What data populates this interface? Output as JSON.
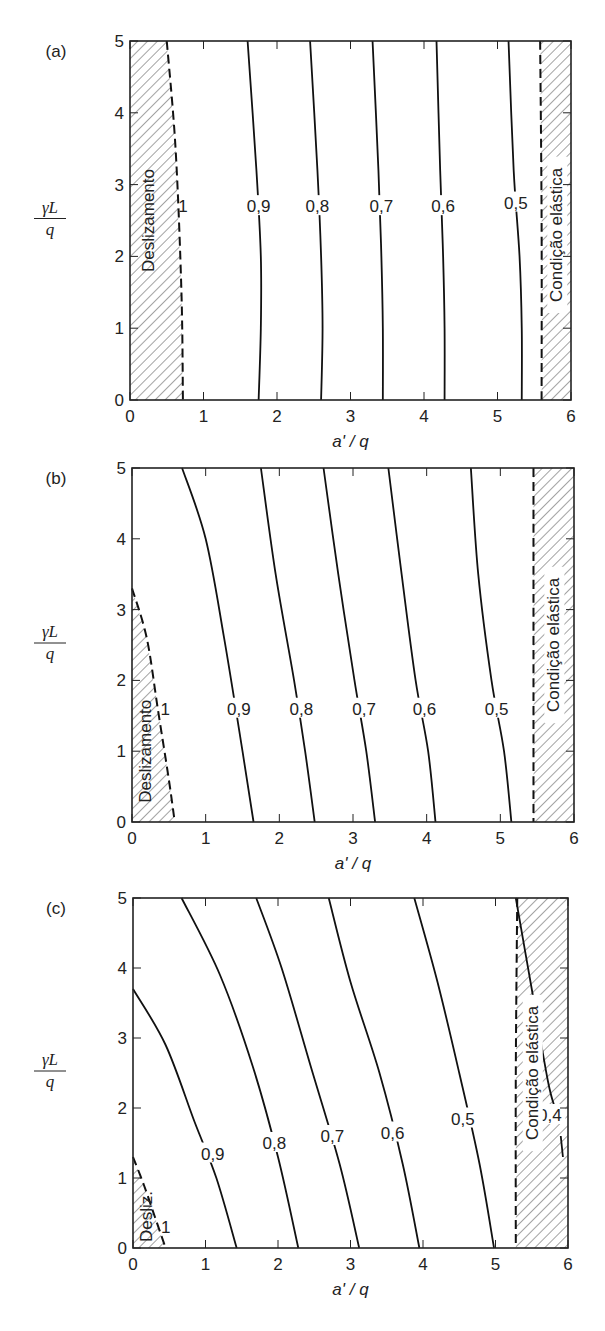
{
  "chart_data": [
    {
      "type": "line",
      "panel": "(a)",
      "xlabel": "a' / q",
      "ylabel_num": "γL",
      "ylabel_den": "q",
      "xlim": [
        0,
        6
      ],
      "ylim": [
        0,
        5
      ],
      "xticks": [
        "0",
        "1",
        "2",
        "3",
        "4",
        "5",
        "6"
      ],
      "yticks": [
        "0",
        "1",
        "2",
        "3",
        "4",
        "5"
      ],
      "frame": {
        "x0": 130,
        "x1": 571,
        "y0": 400,
        "y1": 41
      },
      "zones": [
        {
          "label": "Deslizamento",
          "side": "left",
          "boundary": [
            [
              0.5,
              5
            ],
            [
              0.62,
              3.5
            ],
            [
              0.7,
              1.5
            ],
            [
              0.72,
              0
            ]
          ],
          "label_pos": [
            0.25,
            2.5
          ]
        },
        {
          "label": "Condição elástica",
          "side": "right",
          "boundary": [
            [
              5.58,
              5
            ],
            [
              5.6,
              2.5
            ],
            [
              5.6,
              0
            ]
          ],
          "label_pos": [
            5.8,
            2.3
          ]
        }
      ],
      "series": [
        {
          "name": "1",
          "label_pos": [
            0.72,
            2.7
          ],
          "points": []
        },
        {
          "name": "0,9",
          "label_pos": [
            1.75,
            2.7
          ],
          "points": [
            [
              1.6,
              5
            ],
            [
              1.72,
              3.2
            ],
            [
              1.78,
              2
            ],
            [
              1.78,
              1
            ],
            [
              1.75,
              0
            ]
          ]
        },
        {
          "name": "0,8",
          "label_pos": [
            2.55,
            2.7
          ],
          "points": [
            [
              2.45,
              5
            ],
            [
              2.55,
              3.2
            ],
            [
              2.6,
              2
            ],
            [
              2.62,
              1
            ],
            [
              2.6,
              0
            ]
          ]
        },
        {
          "name": "0,7",
          "label_pos": [
            3.42,
            2.7
          ],
          "points": [
            [
              3.3,
              5
            ],
            [
              3.38,
              3.2
            ],
            [
              3.42,
              2
            ],
            [
              3.44,
              1
            ],
            [
              3.44,
              0
            ]
          ]
        },
        {
          "name": "0,6",
          "label_pos": [
            4.26,
            2.7
          ],
          "points": [
            [
              4.17,
              5
            ],
            [
              4.22,
              3.2
            ],
            [
              4.26,
              2
            ],
            [
              4.28,
              1
            ],
            [
              4.28,
              0
            ]
          ]
        },
        {
          "name": "0,5",
          "label_pos": [
            5.25,
            2.75
          ],
          "points": [
            [
              5.15,
              5
            ],
            [
              5.22,
              3.2
            ],
            [
              5.3,
              2
            ],
            [
              5.33,
              1
            ],
            [
              5.33,
              0
            ]
          ]
        }
      ]
    },
    {
      "type": "line",
      "panel": "(b)",
      "xlabel": "a' / q",
      "ylabel_num": "γL",
      "ylabel_den": "q",
      "xlim": [
        0,
        6
      ],
      "ylim": [
        0,
        5
      ],
      "xticks": [
        "0",
        "1",
        "2",
        "3",
        "4",
        "5",
        "6"
      ],
      "yticks": [
        "0",
        "1",
        "2",
        "3",
        "4",
        "5"
      ],
      "frame": {
        "x0": 132,
        "x1": 574,
        "y0": 822,
        "y1": 468
      },
      "zones": [
        {
          "label": "Deslizamento",
          "side": "left",
          "boundary": [
            [
              0,
              3.3
            ],
            [
              0.2,
              2.6
            ],
            [
              0.35,
              1.6
            ],
            [
              0.5,
              0.6
            ],
            [
              0.58,
              0
            ]
          ],
          "label_pos": [
            0.18,
            1.0
          ]
        },
        {
          "label": "Condição elástica",
          "side": "right",
          "boundary": [
            [
              5.45,
              5
            ],
            [
              5.45,
              0
            ]
          ],
          "label_pos": [
            5.72,
            2.5
          ]
        }
      ],
      "series": [
        {
          "name": "1",
          "label_pos": [
            0.45,
            1.6
          ],
          "points": []
        },
        {
          "name": "0,9",
          "label_pos": [
            1.45,
            1.6
          ],
          "points": [
            [
              0.68,
              5
            ],
            [
              1.0,
              4
            ],
            [
              1.25,
              2.6
            ],
            [
              1.5,
              1
            ],
            [
              1.65,
              0
            ]
          ]
        },
        {
          "name": "0,8",
          "label_pos": [
            2.3,
            1.6
          ],
          "points": [
            [
              1.75,
              5
            ],
            [
              1.95,
              3.5
            ],
            [
              2.2,
              2
            ],
            [
              2.35,
              1
            ],
            [
              2.48,
              0
            ]
          ]
        },
        {
          "name": "0,7",
          "label_pos": [
            3.15,
            1.6
          ],
          "points": [
            [
              2.6,
              5
            ],
            [
              2.8,
              3.5
            ],
            [
              3.02,
              2
            ],
            [
              3.18,
              1
            ],
            [
              3.3,
              0
            ]
          ]
        },
        {
          "name": "0,6",
          "label_pos": [
            3.97,
            1.6
          ],
          "points": [
            [
              3.48,
              5
            ],
            [
              3.66,
              3.5
            ],
            [
              3.85,
              2
            ],
            [
              4.02,
              1
            ],
            [
              4.12,
              0
            ]
          ]
        },
        {
          "name": "0,5",
          "label_pos": [
            4.95,
            1.6
          ],
          "points": [
            [
              4.6,
              5
            ],
            [
              4.7,
              3.5
            ],
            [
              4.88,
              2
            ],
            [
              5.05,
              1
            ],
            [
              5.15,
              0
            ]
          ]
        }
      ]
    },
    {
      "type": "line",
      "panel": "(c)",
      "xlabel": "a' / q",
      "ylabel_num": "γL",
      "ylabel_den": "q",
      "xlim": [
        0,
        6
      ],
      "ylim": [
        0,
        5
      ],
      "xticks": [
        "0",
        "1",
        "2",
        "3",
        "4",
        "5",
        "6"
      ],
      "yticks": [
        "0",
        "1",
        "2",
        "3",
        "4",
        "5"
      ],
      "frame": {
        "x0": 133,
        "x1": 568,
        "y0": 1248,
        "y1": 898
      },
      "zones": [
        {
          "label": "Desliz.",
          "side": "left",
          "boundary": [
            [
              0,
              1.3
            ],
            [
              0.15,
              0.9
            ],
            [
              0.3,
              0.45
            ],
            [
              0.45,
              0
            ]
          ],
          "label_pos": [
            0.18,
            0.45
          ]
        },
        {
          "label": "Condição elástica",
          "side": "right",
          "boundary": [
            [
              5.3,
              5
            ],
            [
              5.28,
              2.5
            ],
            [
              5.28,
              0
            ]
          ],
          "label_pos": [
            5.5,
            2.5
          ]
        }
      ],
      "series": [
        {
          "name": "1",
          "label_pos": [
            0.45,
            0.3
          ],
          "points": []
        },
        {
          "name": "0,9",
          "label_pos": [
            1.1,
            1.35
          ],
          "points": [
            [
              0,
              3.7
            ],
            [
              0.45,
              2.9
            ],
            [
              0.85,
              1.8
            ],
            [
              1.15,
              1.0
            ],
            [
              1.43,
              0
            ]
          ]
        },
        {
          "name": "0,8",
          "label_pos": [
            1.95,
            1.5
          ],
          "points": [
            [
              0.67,
              5
            ],
            [
              1.2,
              3.9
            ],
            [
              1.65,
              2.6
            ],
            [
              2.0,
              1.3
            ],
            [
              2.28,
              0
            ]
          ]
        },
        {
          "name": "0,7",
          "label_pos": [
            2.75,
            1.6
          ],
          "points": [
            [
              1.7,
              5
            ],
            [
              2.05,
              4
            ],
            [
              2.45,
              2.6
            ],
            [
              2.85,
              1.2
            ],
            [
              3.12,
              0
            ]
          ]
        },
        {
          "name": "0,6",
          "label_pos": [
            3.58,
            1.65
          ],
          "points": [
            [
              2.7,
              5
            ],
            [
              3.0,
              3.8
            ],
            [
              3.4,
              2.5
            ],
            [
              3.72,
              1.2
            ],
            [
              3.95,
              0
            ]
          ]
        },
        {
          "name": "0,5",
          "label_pos": [
            4.55,
            1.85
          ],
          "points": [
            [
              3.88,
              5
            ],
            [
              4.2,
              3.8
            ],
            [
              4.5,
              2.5
            ],
            [
              4.78,
              1.2
            ],
            [
              4.98,
              0
            ]
          ]
        },
        {
          "name": "0,4",
          "label_pos": [
            5.75,
            1.9
          ],
          "points": [
            [
              5.28,
              5
            ],
            [
              5.5,
              3.7
            ],
            [
              5.72,
              2.4
            ],
            [
              5.82,
              2.0
            ]
          ],
          "points2": [
            [
              5.9,
              1.6
            ],
            [
              5.93,
              1.3
            ]
          ]
        }
      ]
    }
  ],
  "panel_labels": [
    "(a)",
    "(b)",
    "(c)"
  ],
  "x_axis_label": "a' / q",
  "y_axis_label": {
    "numerator": "γL",
    "denominator": "q"
  }
}
